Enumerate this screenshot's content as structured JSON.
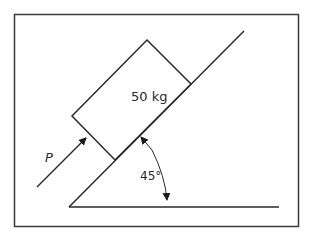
{
  "diagram": {
    "block": {
      "mass_label": "50 kg"
    },
    "force": {
      "label": "P"
    },
    "incline": {
      "angle_label": "45°"
    },
    "colors": {
      "stroke": "#2a2a2a",
      "frame": "#3a3a3a",
      "background": "#ffffff"
    }
  }
}
